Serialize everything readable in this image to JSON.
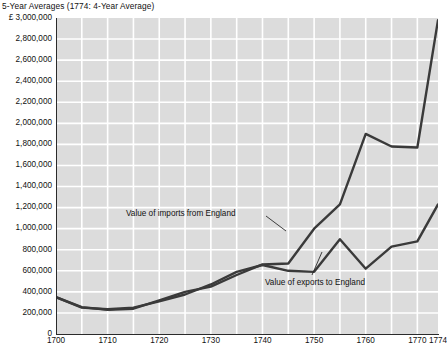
{
  "chart_data": {
    "type": "line",
    "title": "5-Year Averages (1774: 4-Year Average)",
    "xlabel": "",
    "ylabel": "",
    "currency_symbol": "£",
    "xlim": [
      1700,
      1774
    ],
    "ylim": [
      0,
      3000000
    ],
    "ytick_step": 200000,
    "grid": true,
    "grid_color": "#ffffff",
    "plot_background": "#dcdcdc",
    "line_color": "#3a3a3a",
    "legend_position": "inline-annotations",
    "x_tick_labels": [
      "1700",
      "1710",
      "1720",
      "1730",
      "1740",
      "1750",
      "1760",
      "1770",
      "1774"
    ],
    "x_tick_values": [
      1700,
      1710,
      1720,
      1730,
      1740,
      1750,
      1760,
      1770,
      1774
    ],
    "y_tick_labels": [
      "£ 3,000,000",
      "2,800,000",
      "2,600,000",
      "2,400,000",
      "2,200,000",
      "2,000,000",
      "1,800,000",
      "1,600,000",
      "1,400,000",
      "1,200,000",
      "1,000,000",
      "800,000",
      "600,000",
      "400,000",
      "200,000",
      "0"
    ],
    "y_tick_values": [
      3000000,
      2800000,
      2600000,
      2400000,
      2200000,
      2000000,
      1800000,
      1600000,
      1400000,
      1200000,
      1000000,
      800000,
      600000,
      400000,
      200000,
      0
    ],
    "x": [
      1700,
      1705,
      1710,
      1715,
      1720,
      1725,
      1730,
      1735,
      1740,
      1745,
      1750,
      1755,
      1760,
      1765,
      1770,
      1774
    ],
    "series": [
      {
        "name": "Value of imports from England",
        "values": [
          350000,
          255000,
          230000,
          240000,
          320000,
          400000,
          450000,
          560000,
          660000,
          670000,
          1000000,
          1230000,
          1900000,
          1780000,
          1770000,
          2980000
        ]
      },
      {
        "name": "Value of exports to England",
        "values": [
          350000,
          250000,
          235000,
          250000,
          310000,
          375000,
          470000,
          590000,
          655000,
          600000,
          590000,
          900000,
          620000,
          830000,
          880000,
          1230000
        ]
      }
    ],
    "annotations": [
      {
        "text": "Value of imports from England",
        "target_series": "Value of imports from England"
      },
      {
        "text": "Value of exports to England",
        "target_series": "Value of exports to England"
      }
    ]
  }
}
